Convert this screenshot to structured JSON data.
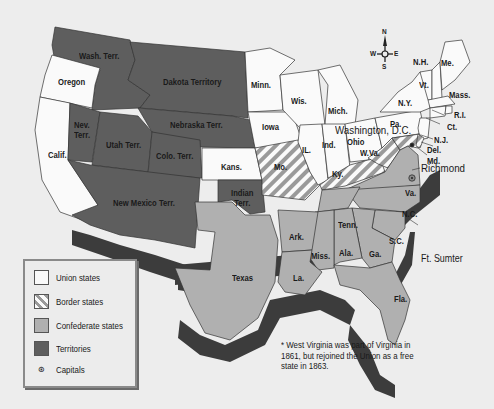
{
  "map": {
    "subject": "United States at the start of the Civil War, 1861",
    "labels": {
      "wash_terr": "Wash. Terr.",
      "oregon": "Oregon",
      "dakota_terr": "Dakota Territory",
      "nev_terr": "Nev.\nTerr.",
      "utah_terr": "Utah Terr.",
      "nebraska_terr": "Nebraska Terr.",
      "colo_terr": "Colo. Terr.",
      "calif": "Calif.",
      "kans": "Kans.",
      "new_mexico_terr": "New Mexico Terr.",
      "indian_terr": "Indian\nTerr.",
      "texas": "Texas",
      "minn": "Minn.",
      "wis": "Wis.",
      "mich": "Mich.",
      "iowa": "Iowa",
      "il": "IL.",
      "ind": "Ind.",
      "ohio": "Ohio",
      "mo": "Mo.",
      "ky": "Ky.",
      "w_va": "W.Va.",
      "pa": "Pa.",
      "ny": "N.Y.",
      "nh": "N.H.",
      "vt": "Vt.",
      "me": "Me.",
      "mass": "Mass.",
      "ri": "R.I.",
      "ct": "Ct.",
      "nj": "N.J.",
      "del": "Del.",
      "md": "Md.",
      "va": "Va.",
      "nc": "N.C.",
      "sc": "S.C.",
      "tenn": "Tenn.",
      "ark": "Ark.",
      "miss": "Miss.",
      "ala": "Ala.",
      "ga": "Ga.",
      "la": "La.",
      "fla": "Fla.",
      "washington_dc": "Washington, D.C.",
      "richmond": "Richmond",
      "ft_sumter": "Ft. Sumter"
    },
    "compass": {
      "n": "N",
      "s": "S",
      "e": "E",
      "w": "W"
    },
    "colors": {
      "union": "#fafafa",
      "border": "#9a9a9a",
      "confederate": "#b0b0b0",
      "territories": "#5e5e5e",
      "shadow": "#3c3c3c",
      "background": "#ededed"
    }
  },
  "legend": {
    "items": [
      {
        "key": "union",
        "label": "Union states"
      },
      {
        "key": "border",
        "label": "Border states"
      },
      {
        "key": "confederate",
        "label": "Confederate states"
      },
      {
        "key": "territories",
        "label": "Territories"
      },
      {
        "key": "capitals",
        "label": "Capitals",
        "symbol": "⊛"
      }
    ]
  },
  "footnote": "* West Virginia was part of Virginia in 1861, but rejoined the Union as a free state in 1863."
}
